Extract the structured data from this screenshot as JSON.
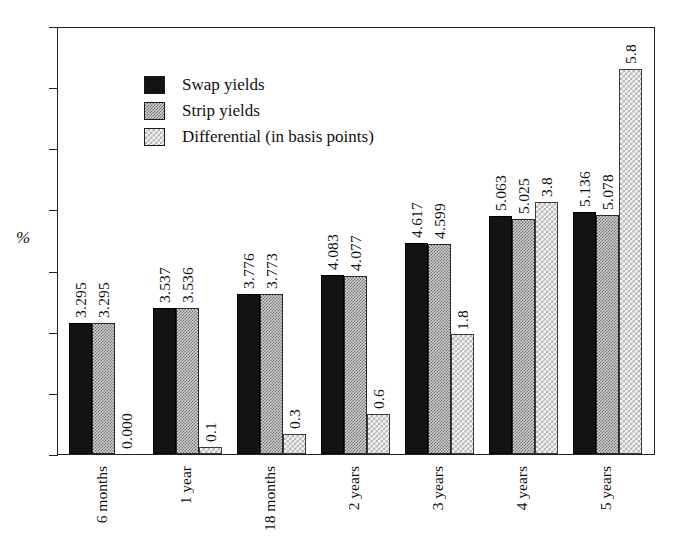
{
  "axis": {
    "ylabel": "%"
  },
  "legend": [
    {
      "label": "Swap yields",
      "key": "swap"
    },
    {
      "label": "Strip yields",
      "key": "strip"
    },
    {
      "label": "Differential (in basis points)",
      "key": "diff"
    }
  ],
  "chart_data": {
    "type": "bar",
    "title": "",
    "xlabel": "",
    "ylabel": "%",
    "grid": false,
    "legend_position": "top-left",
    "categories": [
      "6 months",
      "1 year",
      "18 months",
      "2 years",
      "3 years",
      "4 years",
      "5 years"
    ],
    "series": [
      {
        "name": "Swap yields",
        "values": [
          3.295,
          3.537,
          3.776,
          4.083,
          4.617,
          5.063,
          5.136
        ],
        "labels": [
          "3.295",
          "3.537",
          "3.776",
          "4.083",
          "4.617",
          "5.063",
          "5.136"
        ]
      },
      {
        "name": "Strip yields",
        "values": [
          3.295,
          3.536,
          3.773,
          4.077,
          4.599,
          5.025,
          5.078
        ],
        "labels": [
          "3.295",
          "3.536",
          "3.773",
          "4.077",
          "4.599",
          "5.025",
          "5.078"
        ]
      },
      {
        "name": "Differential (in basis points)",
        "values": [
          0.0,
          0.1,
          0.3,
          0.6,
          1.8,
          3.8,
          5.8
        ],
        "labels": [
          "0.000",
          "0.1",
          "0.3",
          "0.6",
          "1.8",
          "3.8",
          "5.8"
        ]
      }
    ],
    "ytick_count": 8
  }
}
